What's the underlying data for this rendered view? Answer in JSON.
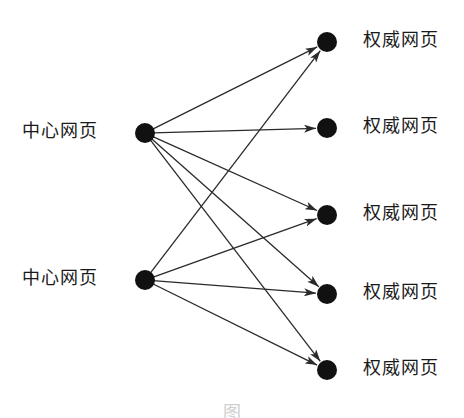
{
  "diagram": {
    "type": "bipartite-link-graph",
    "background": "#ffffff",
    "node_color": "#111111",
    "edge_color": "#2a2a2a",
    "node_radius": 10,
    "hubs": [
      {
        "id": "hub-1",
        "label": "中心网页",
        "x": 145,
        "y": 133,
        "label_x": 22
      },
      {
        "id": "hub-2",
        "label": "中心网页",
        "x": 145,
        "y": 280,
        "label_x": 22
      }
    ],
    "authorities": [
      {
        "id": "auth-1",
        "label": "权威网页",
        "x": 327,
        "y": 42,
        "label_x": 363
      },
      {
        "id": "auth-2",
        "label": "权威网页",
        "x": 327,
        "y": 128,
        "label_x": 363
      },
      {
        "id": "auth-3",
        "label": "权威网页",
        "x": 327,
        "y": 215,
        "label_x": 363
      },
      {
        "id": "auth-4",
        "label": "权威网页",
        "x": 327,
        "y": 294,
        "label_x": 363
      },
      {
        "id": "auth-5",
        "label": "权威网页",
        "x": 327,
        "y": 370,
        "label_x": 363
      }
    ],
    "edges": [
      {
        "from": "hub-1",
        "to": "auth-1"
      },
      {
        "from": "hub-1",
        "to": "auth-2"
      },
      {
        "from": "hub-1",
        "to": "auth-3"
      },
      {
        "from": "hub-1",
        "to": "auth-4"
      },
      {
        "from": "hub-1",
        "to": "auth-5"
      },
      {
        "from": "hub-2",
        "to": "auth-1"
      },
      {
        "from": "hub-2",
        "to": "auth-3"
      },
      {
        "from": "hub-2",
        "to": "auth-4"
      },
      {
        "from": "hub-2",
        "to": "auth-5"
      }
    ],
    "caption": {
      "text": "图",
      "truncated": true
    }
  }
}
